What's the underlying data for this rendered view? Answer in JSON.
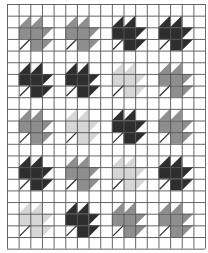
{
  "figure": {
    "grid": {
      "cols": 17,
      "rows": 21,
      "cell_px": 11.65,
      "line_color": "#555555",
      "background": "#ffffff"
    },
    "block": {
      "size_cells": 4,
      "leaf_offset_cells": 1
    },
    "shades": {
      "dark": "#2e2e2e",
      "mid": "#8e8e8e",
      "light": "#d6d6d6"
    },
    "leaf_grid": [
      [
        "mid",
        "mid",
        "dark",
        "dark"
      ],
      [
        "dark",
        "dark",
        "light",
        "mid"
      ],
      [
        "mid",
        "light",
        "dark",
        "mid"
      ],
      [
        "dark",
        "mid",
        "light",
        "dark"
      ],
      [
        "light",
        "dark",
        "mid",
        "mid"
      ]
    ],
    "stem_color": "#333333"
  }
}
